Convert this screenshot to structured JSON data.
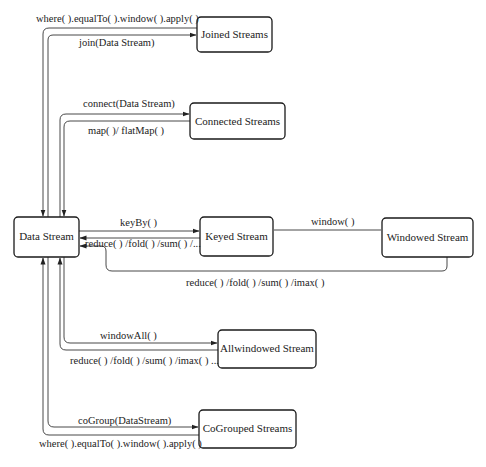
{
  "diagram": {
    "nodes": {
      "data_stream": "Data Stream",
      "joined_streams": "Joined Streams",
      "connected_streams": "Connected Streams",
      "keyed_stream": "Keyed Stream",
      "windowed_stream": "Windowed Stream",
      "allwindowed_stream": "Allwindowed Stream",
      "cogrouped_streams": "CoGrouped Streams"
    },
    "edges": {
      "joined_out": "where( ).equalTo( ).window( ).apply( )",
      "joined_in": "join(Data Stream)",
      "connected_in": "connect(Data Stream)",
      "connected_out": "map( )/ flatMap( )",
      "keyby": "keyBy( )",
      "keyed_reduce": "reduce( ) /fold( ) /sum( ) /...",
      "window": "window( )",
      "windowed_reduce": "reduce( ) /fold( ) /sum( ) /imax( )",
      "windowall": "windowAll( )",
      "allwindowed_reduce": "reduce( ) /fold( ) /sum( ) /imax( ) ...",
      "cogroup_in": "coGroup(DataStream)",
      "cogroup_out": "where( ).equalTo( ).window( ).apply( )"
    },
    "colors": {
      "stroke": "#1a1a1a",
      "text": "#222222",
      "background": "#ffffff"
    }
  }
}
